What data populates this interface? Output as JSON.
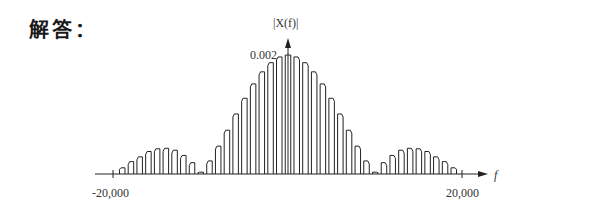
{
  "header": {
    "answer_label": "解答："
  },
  "chart_data": {
    "type": "bar",
    "title": "",
    "xlabel": "f",
    "ylabel": "|X(f)|",
    "y_tick_label": "0.002",
    "x_tick_labels": [
      "-20,000",
      "20,000"
    ],
    "xlim": [
      -20000,
      20000
    ],
    "ylim": [
      0,
      0.002
    ],
    "bar_spacing_hz": 1000,
    "x": [
      -20000,
      -19000,
      -18000,
      -17000,
      -16000,
      -15000,
      -14000,
      -13000,
      -12000,
      -11000,
      -10000,
      -9000,
      -8000,
      -7000,
      -6000,
      -5000,
      -4000,
      -3000,
      -2000,
      -1000,
      0,
      1000,
      2000,
      3000,
      4000,
      5000,
      6000,
      7000,
      8000,
      9000,
      10000,
      11000,
      12000,
      13000,
      14000,
      15000,
      16000,
      17000,
      18000,
      19000,
      20000
    ],
    "values": [
      0,
      0.000104,
      0.000208,
      0.000288,
      0.000378,
      0.000424,
      0.000432,
      0.0004,
      0.000312,
      0.00019,
      3e-05,
      0.00022,
      0.000468,
      0.000736,
      0.001009,
      0.001273,
      0.001514,
      0.001717,
      0.001871,
      0.001967,
      0.002,
      0.001967,
      0.001871,
      0.001717,
      0.001514,
      0.001273,
      0.001009,
      0.000736,
      0.000468,
      0.00022,
      3e-05,
      0.00019,
      0.000312,
      0.0004,
      0.000432,
      0.000424,
      0.000378,
      0.000288,
      0.000208,
      0.000104,
      0
    ],
    "grid": false,
    "legend": null
  }
}
